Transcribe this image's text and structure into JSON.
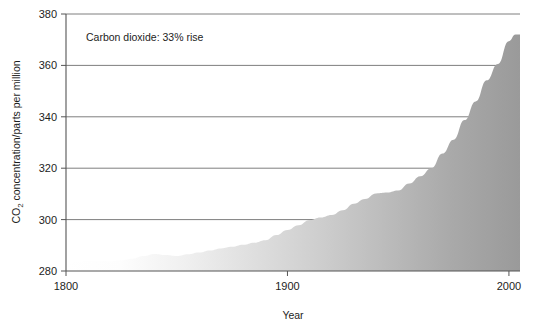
{
  "chart_data": {
    "type": "area",
    "title": "",
    "annotation": "Carbon dioxide: 33% rise",
    "xlabel": "Year",
    "ylabel": "CO2 concentration/parts per million",
    "ylabel_prefix": "CO",
    "ylabel_sub": "2",
    "ylabel_suffix": " concentration/parts per million",
    "xlim": [
      1800,
      2005
    ],
    "ylim": [
      280,
      380
    ],
    "xticks": [
      1800,
      1900,
      2000
    ],
    "xtick_labels": [
      "1800",
      "1900",
      "2000"
    ],
    "yticks": [
      280,
      300,
      320,
      340,
      360,
      380
    ],
    "ytick_labels": [
      "280",
      "300",
      "320",
      "340",
      "360",
      "380"
    ],
    "grid": true,
    "legend": "none",
    "fill_gradient": [
      "#ffffff",
      "#9a9a9a"
    ],
    "series_name": "CO2 concentration",
    "x": [
      1800,
      1805,
      1810,
      1815,
      1820,
      1825,
      1830,
      1835,
      1840,
      1845,
      1850,
      1855,
      1860,
      1865,
      1870,
      1875,
      1880,
      1885,
      1890,
      1895,
      1900,
      1905,
      1910,
      1915,
      1920,
      1925,
      1930,
      1935,
      1940,
      1945,
      1950,
      1955,
      1960,
      1965,
      1970,
      1975,
      1980,
      1985,
      1990,
      1995,
      2000,
      2003
    ],
    "values": [
      283.0,
      283.5,
      284.0,
      284.0,
      283.8,
      284.2,
      284.8,
      285.8,
      286.6,
      286.2,
      285.8,
      286.5,
      287.2,
      288.0,
      288.8,
      289.4,
      290.2,
      291.0,
      292.0,
      294.0,
      296.0,
      297.8,
      299.8,
      300.8,
      301.8,
      303.6,
      306.2,
      308.0,
      310.2,
      310.5,
      311.3,
      314.0,
      316.9,
      320.0,
      325.7,
      331.1,
      338.7,
      346.0,
      354.2,
      360.6,
      369.4,
      372.0
    ]
  },
  "axis_ticks_note": {
    "ytick_count": 6,
    "xtick_count": 3
  }
}
